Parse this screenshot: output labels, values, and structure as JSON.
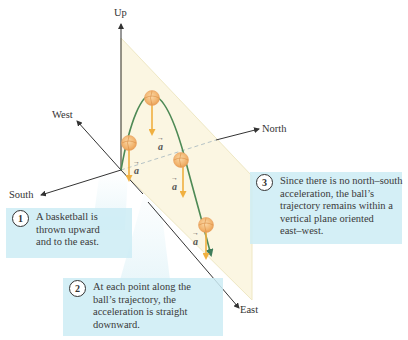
{
  "axes": {
    "up": "Up",
    "west": "West",
    "north": "North",
    "south": "South",
    "east": "East"
  },
  "acceleration_symbol": "a",
  "acceleration_labels": [
    {
      "text": "a",
      "x": 134,
      "y": 166
    },
    {
      "text": "a",
      "x": 161,
      "y": 143
    },
    {
      "text": "a",
      "x": 172,
      "y": 182
    },
    {
      "text": "a",
      "x": 194,
      "y": 238
    }
  ],
  "callouts": [
    {
      "number": "1",
      "lines": [
        "A basketball is",
        "thrown upward",
        "and to the east."
      ]
    },
    {
      "number": "2",
      "lines": [
        "At each point along the",
        "ball’s trajectory, the",
        "acceleration is straight",
        "downward."
      ]
    },
    {
      "number": "3",
      "lines": [
        "Since there is no north–south",
        "acceleration, the ball’s",
        "trajectory remains within a",
        "vertical plane oriented",
        "east–west."
      ]
    }
  ],
  "colors": {
    "axis": "#333333",
    "plane_fill": "#fbf6e2",
    "plane_edge": "#ece4b8",
    "trajectory": "#4e8a55",
    "acceleration_arrow": "#f0b040",
    "ball": "#f2b570",
    "callout_bg": "#cdecf4"
  }
}
